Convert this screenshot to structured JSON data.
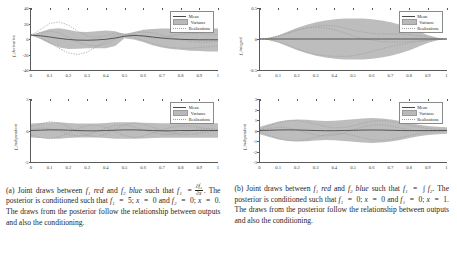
{
  "figure": {
    "panels": [
      {
        "id": "panel-a",
        "caption_parts": {
          "lead": "(a) Joint draws between",
          "f1": "f₁",
          "color1": "red",
          "and": "and",
          "f2": "f₂",
          "color2": "blue",
          "such_that": "such that",
          "relation_lhs": "f₁",
          "relation_eq": "=",
          "frac_num": "∂f₂",
          "frac_den": "∂x",
          "sentence2": ". The posterior is conditioned such that",
          "cond1": "f₁",
          "cond1_val": "5;",
          "cond1_x": "x",
          "cond1_xval": "0",
          "cond2": "f₂",
          "cond2_val": "0;",
          "cond2_x": "x",
          "cond2_xval": "0",
          "tail": ". The draws from the posterior follow the relationship between outputs and also the conditioning."
        },
        "plots": [
          {
            "id": "plot-a-top",
            "ylabel": "f_derivative",
            "yticks": [
              "40",
              "20",
              "0",
              "-20",
              "-40"
            ],
            "ytick_values": [
              40,
              20,
              0,
              -20,
              -40
            ],
            "ylim": [
              -40,
              40
            ],
            "xticks": [
              "0",
              "0.1",
              "0.2",
              "0.3",
              "0.4",
              "0.5",
              "0.6",
              "0.7",
              "0.8",
              "0.9",
              "1"
            ],
            "xlim": [
              0,
              1
            ],
            "legend": [
              "Mean",
              "Variance",
              "Realizations"
            ]
          },
          {
            "id": "plot-a-bottom",
            "ylabel": "f_independent",
            "yticks": [
              "5",
              "0",
              "-5"
            ],
            "ytick_values": [
              5,
              0,
              -5
            ],
            "ylim": [
              -5,
              5
            ],
            "xticks": [
              "0",
              "0.1",
              "0.2",
              "0.3",
              "0.4",
              "0.5",
              "0.6",
              "0.7",
              "0.8",
              "0.9",
              "1"
            ],
            "xlim": [
              0,
              1
            ],
            "legend": [
              "Mean",
              "Variance",
              "Realizations"
            ]
          }
        ]
      },
      {
        "id": "panel-b",
        "caption_parts": {
          "lead": "(b) Joint draws between",
          "f1": "f₁",
          "color1": "red",
          "and": "and",
          "f2": "f₂",
          "color2": "blue",
          "such_that": "such that",
          "relation_lhs": "f₁",
          "relation_eq": "=",
          "integral": "∫ f₂",
          "sentence2": ". The posterior is conditioned such that",
          "cond1": "f₁",
          "cond1_val": "0;",
          "cond1_x": "x",
          "cond1_xval": "0",
          "cond2": "f₁",
          "cond2_val": "0;",
          "cond2_x": "x",
          "cond2_xval": "1",
          "tail": ". The draws from the posterior follow the relationship between outputs and also the conditioning."
        },
        "plots": [
          {
            "id": "plot-b-top",
            "ylabel": "f_integral",
            "yticks": [
              "0.5",
              "0",
              "-0.5"
            ],
            "ytick_values": [
              0.5,
              0,
              -0.5
            ],
            "ylim": [
              -0.5,
              0.5
            ],
            "xticks": [
              "0",
              "0.1",
              "0.2",
              "0.3",
              "0.4",
              "0.5",
              "0.6",
              "0.7",
              "0.8",
              "0.9",
              "1"
            ],
            "xlim": [
              0,
              1
            ],
            "legend": [
              "Mean",
              "Variance",
              "Realizations"
            ]
          },
          {
            "id": "plot-b-bottom",
            "ylabel": "f_independent",
            "yticks": [
              "3",
              "2",
              "1",
              "0",
              "-1",
              "-2",
              "-3"
            ],
            "ytick_values": [
              3,
              2,
              1,
              0,
              -1,
              -2,
              -3
            ],
            "ylim": [
              -3,
              3
            ],
            "xticks": [
              "0",
              "0.1",
              "0.2",
              "0.3",
              "0.4",
              "0.5",
              "0.6",
              "0.7",
              "0.8",
              "0.9",
              "1"
            ],
            "xlim": [
              0,
              1
            ],
            "legend": [
              "Mean",
              "Variance",
              "Realizations"
            ]
          }
        ]
      }
    ],
    "colors": {
      "variance_band": "#b9b9b9",
      "mean_line": "#4a4a4a",
      "realizations": "#9e9e9e",
      "axis": "#5a5a5a",
      "text": "#1f1f1f",
      "background": "#ffffff"
    }
  },
  "chart_data": [
    {
      "id": "plot-a-top",
      "type": "line",
      "title": "",
      "xlabel": "",
      "ylabel": "f_derivative",
      "xlim": [
        0,
        1
      ],
      "ylim": [
        -40,
        40
      ],
      "grid": false,
      "legend_position": "top-right",
      "legend": [
        "Mean",
        "Variance",
        "Realizations"
      ],
      "x": [
        0,
        0.05,
        0.1,
        0.15,
        0.2,
        0.25,
        0.3,
        0.35,
        0.4,
        0.45,
        0.5,
        0.55,
        0.6,
        0.65,
        0.7,
        0.75,
        0.8,
        0.85,
        0.9,
        0.95,
        1
      ],
      "series": [
        {
          "name": "Mean",
          "values": [
            5,
            4.2,
            2.6,
            0.8,
            -0.6,
            -1.4,
            -1.6,
            -1.2,
            -0.4,
            1.2,
            3.6,
            4.6,
            4.0,
            2.6,
            1.2,
            0.2,
            -0.4,
            -0.8,
            -1.0,
            -1.0,
            -1.0
          ]
        },
        {
          "name": "VarianceUpper",
          "values": [
            5,
            9,
            13,
            14,
            12,
            9.5,
            9,
            10,
            11,
            10,
            6,
            9,
            12,
            13,
            13.5,
            13.5,
            13.5,
            13.5,
            13.5,
            13.5,
            13.5
          ]
        },
        {
          "name": "VarianceLower",
          "values": [
            5,
            0,
            -6,
            -11,
            -13,
            -12.5,
            -12,
            -12,
            -12,
            -9,
            1,
            -0.5,
            -4,
            -8,
            -11,
            -13,
            -14,
            -15,
            -15.5,
            -16,
            -16
          ]
        },
        {
          "name": "Realization1",
          "values": [
            5,
            12,
            20,
            22,
            18,
            10,
            4,
            2,
            4,
            8,
            6,
            2,
            -2,
            -6,
            -9,
            -11,
            -12,
            -12,
            -11,
            -10,
            -9
          ]
        },
        {
          "name": "Realization2",
          "values": [
            5,
            2,
            -4,
            -12,
            -18,
            -20,
            -17,
            -10,
            -2,
            5,
            7,
            6,
            3,
            1,
            2,
            4,
            6,
            7,
            7,
            6,
            5
          ]
        },
        {
          "name": "Realization3",
          "values": [
            5,
            8,
            10,
            8,
            2,
            -4,
            -8,
            -9,
            -6,
            0,
            5,
            8,
            9,
            8,
            5,
            2,
            -1,
            -3,
            -4,
            -4,
            -3
          ]
        }
      ]
    },
    {
      "id": "plot-a-bottom",
      "type": "line",
      "title": "",
      "xlabel": "",
      "ylabel": "f_independent",
      "xlim": [
        0,
        1
      ],
      "ylim": [
        -5,
        5
      ],
      "grid": false,
      "legend_position": "top-right",
      "legend": [
        "Mean",
        "Variance",
        "Realizations"
      ],
      "x": [
        0,
        0.05,
        0.1,
        0.15,
        0.2,
        0.25,
        0.3,
        0.35,
        0.4,
        0.45,
        0.5,
        0.55,
        0.6,
        0.65,
        0.7,
        0.75,
        0.8,
        0.85,
        0.9,
        0.95,
        1
      ],
      "series": [
        {
          "name": "Mean",
          "values": [
            0,
            0.05,
            0.1,
            0.1,
            0.05,
            0,
            -0.05,
            -0.05,
            0,
            0.05,
            0.1,
            0.1,
            0.05,
            0,
            -0.05,
            -0.05,
            0,
            0,
            0,
            0,
            0
          ]
        },
        {
          "name": "VarianceUpper",
          "values": [
            1.1,
            1.2,
            1.3,
            1.3,
            1.2,
            1.1,
            1.1,
            1.1,
            1.2,
            1.3,
            1.3,
            1.3,
            1.25,
            1.2,
            1.15,
            1.15,
            1.15,
            1.15,
            1.15,
            1.15,
            1.15
          ]
        },
        {
          "name": "VarianceLower",
          "values": [
            -1.1,
            -1.2,
            -1.3,
            -1.3,
            -1.2,
            -1.1,
            -1.1,
            -1.1,
            -1.2,
            -1.3,
            -1.3,
            -1.3,
            -1.25,
            -1.2,
            -1.15,
            -1.15,
            -1.15,
            -1.15,
            -1.15,
            -1.15,
            -1.15
          ]
        },
        {
          "name": "Realization1",
          "values": [
            0.6,
            1.0,
            1.4,
            1.2,
            0.6,
            -0.2,
            -0.8,
            -1.0,
            -0.6,
            0.2,
            0.9,
            1.2,
            1.0,
            0.5,
            0,
            -0.4,
            -0.6,
            -0.6,
            -0.4,
            -0.2,
            0
          ]
        },
        {
          "name": "Realization2",
          "values": [
            -0.7,
            -1.1,
            -1.3,
            -1.0,
            -0.4,
            0.3,
            0.8,
            0.9,
            0.5,
            -0.2,
            -0.8,
            -1.1,
            -0.9,
            -0.4,
            0.1,
            0.5,
            0.7,
            0.7,
            0.5,
            0.2,
            0
          ]
        },
        {
          "name": "Realization3",
          "values": [
            0.2,
            0.4,
            0.3,
            -0.1,
            -0.6,
            -0.9,
            -0.7,
            -0.2,
            0.4,
            0.8,
            0.9,
            0.6,
            0.1,
            -0.3,
            -0.6,
            -0.6,
            -0.4,
            -0.1,
            0.2,
            0.3,
            0.2
          ]
        }
      ]
    },
    {
      "id": "plot-b-top",
      "type": "line",
      "title": "",
      "xlabel": "",
      "ylabel": "f_integral",
      "xlim": [
        0,
        1
      ],
      "ylim": [
        -0.5,
        0.5
      ],
      "grid": false,
      "legend_position": "top-right",
      "legend": [
        "Mean",
        "Variance",
        "Realizations"
      ],
      "x": [
        0,
        0.05,
        0.1,
        0.15,
        0.2,
        0.25,
        0.3,
        0.35,
        0.4,
        0.45,
        0.5,
        0.55,
        0.6,
        0.65,
        0.7,
        0.75,
        0.8,
        0.85,
        0.9,
        0.95,
        1
      ],
      "series": [
        {
          "name": "Mean",
          "values": [
            0,
            0,
            0,
            0,
            0,
            0,
            0,
            0,
            0,
            0,
            0,
            0,
            0,
            0,
            0,
            0,
            0,
            0,
            0,
            0,
            0
          ]
        },
        {
          "name": "VarianceUpper",
          "values": [
            0,
            0.02,
            0.06,
            0.12,
            0.18,
            0.23,
            0.27,
            0.3,
            0.32,
            0.33,
            0.33,
            0.33,
            0.32,
            0.3,
            0.27,
            0.23,
            0.18,
            0.12,
            0.06,
            0.02,
            0
          ]
        },
        {
          "name": "VarianceLower",
          "values": [
            0,
            -0.02,
            -0.06,
            -0.12,
            -0.18,
            -0.23,
            -0.27,
            -0.3,
            -0.32,
            -0.33,
            -0.33,
            -0.33,
            -0.32,
            -0.3,
            -0.27,
            -0.23,
            -0.18,
            -0.12,
            -0.06,
            -0.02,
            0
          ]
        },
        {
          "name": "Realization1",
          "values": [
            0,
            0.01,
            0.04,
            0.09,
            0.14,
            0.18,
            0.21,
            0.22,
            0.21,
            0.18,
            0.14,
            0.11,
            0.09,
            0.08,
            0.08,
            0.08,
            0.07,
            0.05,
            0.03,
            0.01,
            0
          ]
        },
        {
          "name": "Realization2",
          "values": [
            0,
            -0.01,
            -0.05,
            -0.1,
            -0.16,
            -0.21,
            -0.25,
            -0.27,
            -0.28,
            -0.28,
            -0.27,
            -0.24,
            -0.2,
            -0.16,
            -0.12,
            -0.09,
            -0.06,
            -0.04,
            -0.02,
            -0.01,
            0
          ]
        },
        {
          "name": "Realization3",
          "values": [
            0,
            0.015,
            0.05,
            0.1,
            0.15,
            0.18,
            0.19,
            0.18,
            0.15,
            0.1,
            0.05,
            0.01,
            -0.02,
            -0.04,
            -0.05,
            -0.05,
            -0.04,
            -0.03,
            -0.02,
            -0.005,
            0
          ]
        }
      ]
    },
    {
      "id": "plot-b-bottom",
      "type": "line",
      "title": "",
      "xlabel": "",
      "ylabel": "f_independent",
      "xlim": [
        0,
        1
      ],
      "ylim": [
        -3,
        3
      ],
      "grid": false,
      "legend_position": "top-right",
      "legend": [
        "Mean",
        "Variance",
        "Realizations"
      ],
      "x": [
        0,
        0.05,
        0.1,
        0.15,
        0.2,
        0.25,
        0.3,
        0.35,
        0.4,
        0.45,
        0.5,
        0.55,
        0.6,
        0.65,
        0.7,
        0.75,
        0.8,
        0.85,
        0.9,
        0.95,
        1
      ],
      "series": [
        {
          "name": "Mean",
          "values": [
            0,
            0.02,
            0.05,
            0.06,
            0.05,
            0.02,
            0,
            -0.02,
            -0.02,
            0,
            0.02,
            0.04,
            0.05,
            0.04,
            0.02,
            0,
            -0.01,
            -0.01,
            0,
            0,
            0
          ]
        },
        {
          "name": "VarianceUpper",
          "values": [
            0.35,
            0.62,
            0.85,
            1.0,
            1.05,
            1.02,
            0.95,
            0.9,
            0.92,
            1.0,
            1.08,
            1.15,
            1.18,
            1.15,
            1.05,
            0.9,
            0.72,
            0.55,
            0.42,
            0.35,
            0.32
          ]
        },
        {
          "name": "VarianceLower",
          "values": [
            -0.35,
            -0.62,
            -0.85,
            -1.0,
            -1.05,
            -1.02,
            -0.95,
            -0.9,
            -0.92,
            -1.0,
            -1.08,
            -1.15,
            -1.18,
            -1.15,
            -1.05,
            -0.9,
            -0.72,
            -0.55,
            -0.42,
            -0.35,
            -0.32
          ]
        },
        {
          "name": "Realization1",
          "values": [
            0.1,
            0.45,
            0.75,
            0.92,
            0.95,
            0.82,
            0.6,
            0.38,
            0.25,
            0.28,
            0.45,
            0.68,
            0.88,
            0.95,
            0.88,
            0.7,
            0.5,
            0.32,
            0.18,
            0.1,
            0.05
          ]
        },
        {
          "name": "Realization2",
          "values": [
            -0.12,
            -0.48,
            -0.78,
            -0.95,
            -0.98,
            -0.85,
            -0.62,
            -0.4,
            -0.28,
            -0.3,
            -0.48,
            -0.7,
            -0.88,
            -0.95,
            -0.86,
            -0.68,
            -0.48,
            -0.3,
            -0.16,
            -0.08,
            -0.04
          ]
        },
        {
          "name": "Realization3",
          "values": [
            0.05,
            0.2,
            0.3,
            0.25,
            0.05,
            -0.2,
            -0.42,
            -0.52,
            -0.45,
            -0.22,
            0.08,
            0.35,
            0.52,
            0.55,
            0.42,
            0.22,
            0.05,
            -0.05,
            -0.08,
            -0.05,
            0
          ]
        }
      ]
    }
  ]
}
